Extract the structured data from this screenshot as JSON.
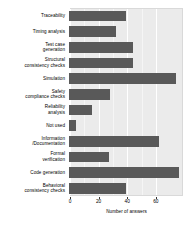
{
  "chart_data": {
    "type": "bar",
    "orientation": "horizontal",
    "title": "",
    "subtitle": "",
    "xlabel": "Number of answers",
    "ylabel": "",
    "xlim": [
      0,
      79
    ],
    "xticks": [
      0,
      20,
      40,
      60
    ],
    "xticklabels": [
      "0",
      "20",
      "40",
      "60"
    ],
    "grid": true,
    "grid_color": "#ffffff",
    "panel_background": "#ebebeb",
    "bar_color": "#595959",
    "legend": null,
    "categories": [
      "Traceability",
      "Timing analysis",
      "Test case\ngeneration",
      "Structural\nconsistency checks",
      "Simulation",
      "Safety\ncompliance checks",
      "Reliability\nanalysis",
      "Not used",
      "Information\n/Documentation",
      "Formal\nverification",
      "Code generation",
      "Behavioral\nconsistency checks"
    ],
    "values": [
      40,
      33,
      45,
      45,
      75,
      29,
      16,
      5,
      63,
      28,
      77,
      40
    ],
    "series": [
      {
        "name": "Number of answers",
        "values": [
          40,
          33,
          45,
          45,
          75,
          29,
          16,
          5,
          63,
          28,
          77,
          40
        ]
      }
    ]
  },
  "axis": {
    "xlabel": "Number of answers",
    "ticks": [
      {
        "label": "0",
        "value": 0
      },
      {
        "label": "20",
        "value": 20
      },
      {
        "label": "40",
        "value": 40
      },
      {
        "label": "60",
        "value": 60
      }
    ]
  },
  "categories": [
    {
      "label": "Traceability",
      "value": 40
    },
    {
      "label": "Timing analysis",
      "value": 33
    },
    {
      "label": "Test case\ngeneration",
      "value": 45
    },
    {
      "label": "Structural\nconsistency checks",
      "value": 45
    },
    {
      "label": "Simulation",
      "value": 75
    },
    {
      "label": "Safety\ncompliance checks",
      "value": 29
    },
    {
      "label": "Reliability\nanalysis",
      "value": 16
    },
    {
      "label": "Not used",
      "value": 5
    },
    {
      "label": "Information\n/Documentation",
      "value": 63
    },
    {
      "label": "Formal\nverification",
      "value": 28
    },
    {
      "label": "Code generation",
      "value": 77
    },
    {
      "label": "Behavioral\nconsistency checks",
      "value": 40
    }
  ]
}
